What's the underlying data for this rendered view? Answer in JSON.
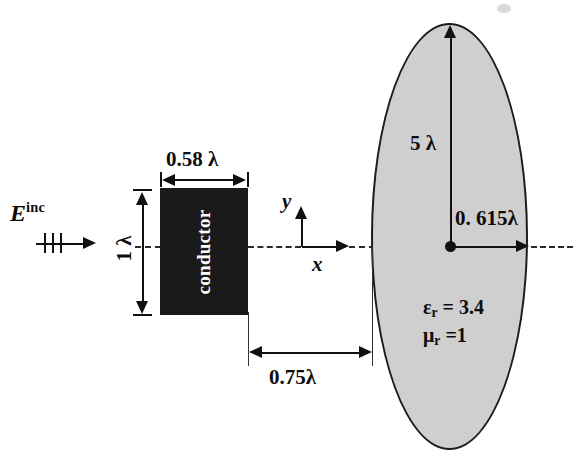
{
  "figure": {
    "incident_field": {
      "label_base": "E",
      "label_sup": "inc",
      "arrow_icon": "incident-wave-arrow"
    },
    "conductor": {
      "label": "conductor",
      "width_label": "0.58 λ",
      "height_label": "1 λ",
      "fill_color": "#1a1a1a",
      "text_color": "#ffffff"
    },
    "dielectric": {
      "semi_major_label": "5 λ",
      "semi_minor_label": "0. 615λ",
      "epsilon_r": "ε",
      "epsilon_r_sub": "r",
      "epsilon_r_value": " = 3.4",
      "mu_r": "μ",
      "mu_r_sub": "r",
      "mu_r_value": " =1",
      "fill_color": "#cfcfcf",
      "outline_color": "#1c1c1c"
    },
    "separation": {
      "label": "0.75λ"
    },
    "axes": {
      "x_label": "x",
      "y_label": "y"
    }
  }
}
